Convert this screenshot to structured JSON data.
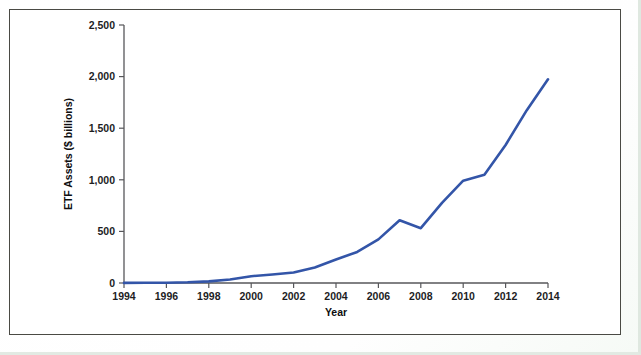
{
  "figure": {
    "frame_border_color": "#4a4a44",
    "background_color": "#ffffff",
    "page_edge_color": "#dfe8e0"
  },
  "chart_data": {
    "type": "line",
    "title": "",
    "xlabel": "Year",
    "ylabel": "ETF Assets ($ billions)",
    "xlim": [
      1994,
      2014
    ],
    "ylim": [
      0,
      2500
    ],
    "grid": false,
    "legend": false,
    "legend_position": "none",
    "series_color": "#3355a8",
    "x_tick_labels": [
      "1994",
      "1996",
      "1998",
      "2000",
      "2002",
      "2004",
      "2006",
      "2008",
      "2010",
      "2012",
      "2014"
    ],
    "x_ticks": [
      1994,
      1996,
      1998,
      2000,
      2002,
      2004,
      2006,
      2008,
      2010,
      2012,
      2014
    ],
    "y_tick_labels": [
      "0",
      "500",
      "1,000",
      "1,500",
      "2,000",
      "2,500"
    ],
    "y_ticks": [
      0,
      500,
      1000,
      1500,
      2000,
      2500
    ],
    "x": [
      1994,
      1995,
      1996,
      1997,
      1998,
      1999,
      2000,
      2001,
      2002,
      2003,
      2004,
      2005,
      2006,
      2007,
      2008,
      2009,
      2010,
      2011,
      2012,
      2013,
      2014
    ],
    "series": [
      {
        "name": "ETF Assets",
        "values": [
          1,
          2,
          3,
          7,
          16,
          34,
          66,
          83,
          102,
          151,
          228,
          301,
          423,
          608,
          531,
          777,
          992,
          1048,
          1337,
          1675,
          1974
        ]
      }
    ]
  }
}
